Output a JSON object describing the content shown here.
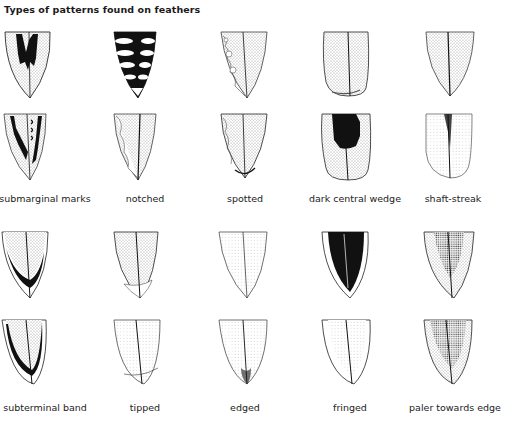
{
  "title": "Types of patterns found on feathers",
  "columns": 5,
  "rows": [
    {
      "cells": [
        {
          "pattern": "submarginal-marks",
          "variant": "a"
        },
        {
          "pattern": "notched",
          "variant": "a"
        },
        {
          "pattern": "spotted",
          "variant": "a"
        },
        {
          "pattern": "dark-central-wedge",
          "variant": "a"
        },
        {
          "pattern": "shaft-streak",
          "variant": "a"
        }
      ]
    },
    {
      "cells": [
        {
          "pattern": "submarginal-marks",
          "variant": "b"
        },
        {
          "pattern": "notched",
          "variant": "b"
        },
        {
          "pattern": "spotted",
          "variant": "b"
        },
        {
          "pattern": "dark-central-wedge",
          "variant": "b"
        },
        {
          "pattern": "shaft-streak",
          "variant": "b"
        }
      ],
      "labels": [
        "submarginal marks",
        "notched",
        "spotted",
        "dark central wedge",
        "shaft-streak"
      ]
    },
    {
      "cells": [
        {
          "pattern": "subterminal-band",
          "variant": "a"
        },
        {
          "pattern": "tipped",
          "variant": "a"
        },
        {
          "pattern": "edged",
          "variant": "a"
        },
        {
          "pattern": "fringed",
          "variant": "a"
        },
        {
          "pattern": "paler-towards-edge",
          "variant": "a"
        }
      ]
    },
    {
      "cells": [
        {
          "pattern": "subterminal-band",
          "variant": "b"
        },
        {
          "pattern": "tipped",
          "variant": "b"
        },
        {
          "pattern": "edged",
          "variant": "b"
        },
        {
          "pattern": "fringed",
          "variant": "b"
        },
        {
          "pattern": "paler-towards-edge",
          "variant": "b"
        }
      ],
      "labels": [
        "subterminal band",
        "tipped",
        "edged",
        "fringed",
        "paler towards edge"
      ]
    }
  ],
  "colors": {
    "ink": "#111111",
    "stipple": "#9a9a9a",
    "background": "#ffffff"
  }
}
